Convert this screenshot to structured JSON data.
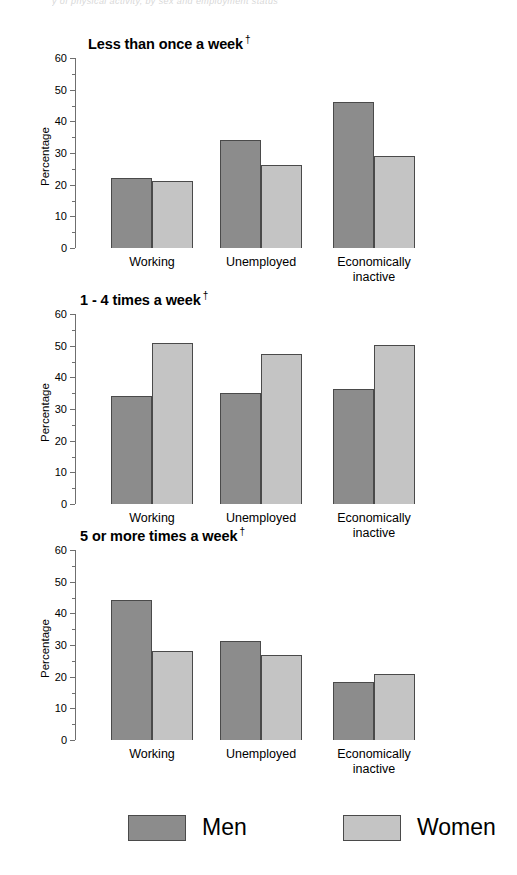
{
  "figure": {
    "cut_off_header": "y of physical activity, by sex and employment status",
    "ylabel": "Percentage",
    "dagger": "†"
  },
  "legend": {
    "position": "bottom",
    "items": [
      {
        "label": "Men",
        "color": "#8c8c8c",
        "swatch_name": "legend-swatch-men"
      },
      {
        "label": "Women",
        "color": "#c4c4c4",
        "swatch_name": "legend-swatch-women"
      }
    ]
  },
  "chart_data": [
    {
      "type": "bar",
      "title": "Less than once a week",
      "title_marker": "†",
      "xlabel": "",
      "ylabel": "Percentage",
      "ylim": [
        0,
        60
      ],
      "yticks": [
        0,
        10,
        20,
        30,
        40,
        50,
        60
      ],
      "yticks_minor": [
        5,
        15,
        25,
        35,
        45,
        55
      ],
      "grid": false,
      "categories": [
        "Working",
        "Unemployed",
        "Economically\ninactive"
      ],
      "series": [
        {
          "name": "Men",
          "color": "#8c8c8c",
          "values": [
            22.0,
            34.0,
            46.1
          ]
        },
        {
          "name": "Women",
          "color": "#c4c4c4",
          "values": [
            21.3,
            26.3,
            29.2
          ]
        }
      ]
    },
    {
      "type": "bar",
      "title": "1 - 4 times a week",
      "title_marker": "†",
      "xlabel": "",
      "ylabel": "Percentage",
      "ylim": [
        0,
        60
      ],
      "yticks": [
        0,
        10,
        20,
        30,
        40,
        50,
        60
      ],
      "yticks_minor": [
        5,
        15,
        25,
        35,
        45,
        55
      ],
      "grid": false,
      "categories": [
        "Working",
        "Unemployed",
        "Economically\ninactive"
      ],
      "series": [
        {
          "name": "Men",
          "color": "#8c8c8c",
          "values": [
            34.0,
            35.0,
            36.3
          ]
        },
        {
          "name": "Women",
          "color": "#c4c4c4",
          "values": [
            50.8,
            47.4,
            50.2
          ]
        }
      ]
    },
    {
      "type": "bar",
      "title": "5 or more times a week",
      "title_marker": "†",
      "xlabel": "",
      "ylabel": "Percentage",
      "ylim": [
        0,
        60
      ],
      "yticks": [
        0,
        10,
        20,
        30,
        40,
        50,
        60
      ],
      "yticks_minor": [
        5,
        15,
        25,
        35,
        45,
        55
      ],
      "grid": false,
      "categories": [
        "Working",
        "Unemployed",
        "Economically\ninactive"
      ],
      "series": [
        {
          "name": "Men",
          "color": "#8c8c8c",
          "values": [
            44.2,
            31.2,
            18.2
          ]
        },
        {
          "name": "Women",
          "color": "#c4c4c4",
          "values": [
            28.0,
            27.0,
            21.0
          ]
        }
      ]
    }
  ]
}
